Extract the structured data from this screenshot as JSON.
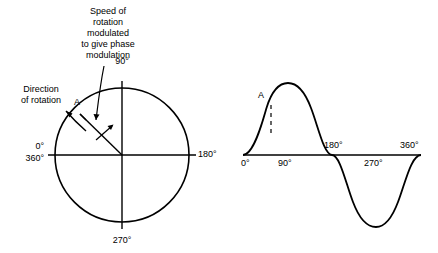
{
  "figure": {
    "annotations": {
      "speed_note": "Speed of\nrotation\nmodulated\nto give phase\nmodulation",
      "direction_note": "Direction\nof rotation",
      "point_label_left": "A",
      "point_label_right": "A"
    },
    "circle_diagram": {
      "labels": {
        "top": "90°",
        "right": "180°",
        "bottom": "270°",
        "left_top": "0°",
        "left_bottom": "360°"
      }
    },
    "wave_diagram": {
      "axis_labels": [
        "0°",
        "90°",
        "180°",
        "270°",
        "360°"
      ]
    },
    "colors": {
      "stroke": "#000000",
      "background": "#ffffff"
    }
  }
}
